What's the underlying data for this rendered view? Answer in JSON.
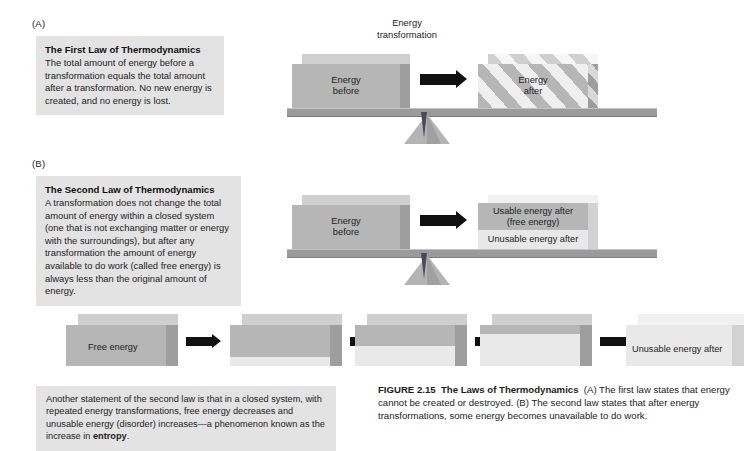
{
  "panels": {
    "a": {
      "letter": "(A)",
      "law_title": "The First Law of Thermodynamics",
      "law_body": "The total amount of energy before a transformation equals the total amount after a transformation. No new energy is created, and no energy is lost.",
      "transformation_label_line1": "Energy",
      "transformation_label_line2": "transformation",
      "left_block_line1": "Energy",
      "left_block_line2": "before",
      "right_block_line1": "Energy",
      "right_block_line2": "after"
    },
    "b": {
      "letter": "(B)",
      "law_title": "The Second Law of Thermodynamics",
      "law_body": "A transformation does not change the total amount of energy within a closed system (one that is not exchanging matter or energy with the surroundings), but after any transformation the amount of energy available to do work (called free energy) is always less than the original amount of energy.",
      "left_block_line1": "Energy",
      "left_block_line2": "before",
      "usable_line1": "Usable energy after",
      "usable_line2": "(free energy)",
      "unusable_label": "Unusable energy after"
    }
  },
  "sequence": {
    "first_label": "Free energy",
    "last_label": "Unusable energy after",
    "blocks": [
      {
        "free_fraction": 1.0
      },
      {
        "free_fraction": 0.78
      },
      {
        "free_fraction": 0.5
      },
      {
        "free_fraction": 0.22
      },
      {
        "free_fraction": 0.0
      }
    ]
  },
  "note": {
    "text_before_bold": "Another statement of the second law is that in a closed system, with repeated energy transformations, free energy decreases and unusable energy (disorder) increases—a phenomenon known as the increase in ",
    "bold_word": "entropy",
    "text_after_bold": "."
  },
  "caption": {
    "figure_number": "FIGURE 2.15",
    "figure_title": "The Laws of Thermodynamics",
    "body": "(A) The first law states that energy cannot be created or destroyed. (B) The second law states that after energy transformations, some energy becomes unavailable to do work."
  },
  "colors": {
    "box_background": "#e3e3e3",
    "block_grey": "#b6b6b6",
    "block_light": "#e8e8e8",
    "beam": "#9b9b9b",
    "arrow": "#111111"
  }
}
